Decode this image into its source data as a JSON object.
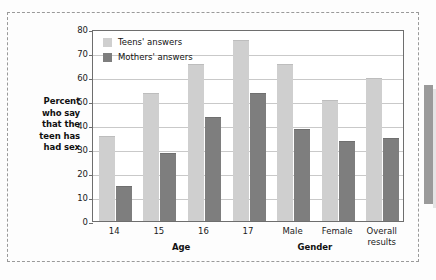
{
  "chart_data": {
    "type": "bar",
    "title": "",
    "xlabel": "",
    "ylabel": "Percent who say that the teen has had sex",
    "ylim": [
      0,
      80
    ],
    "yticks": [
      0,
      10,
      20,
      30,
      40,
      50,
      60,
      70,
      80
    ],
    "grid": true,
    "legend_position": "top-left",
    "categories": [
      "14",
      "15",
      "16",
      "17",
      "Male",
      "Female",
      "Overall results"
    ],
    "series": [
      {
        "name": "Teens' answers",
        "color": "#cfcfcf",
        "values": [
          35,
          53,
          65,
          75,
          65,
          50,
          59
        ]
      },
      {
        "name": "Mothers' answers",
        "color": "#7e7e7e",
        "values": [
          14,
          28,
          43,
          53,
          38,
          33,
          34
        ]
      }
    ],
    "group_labels": [
      {
        "label": "Age",
        "categories": [
          "14",
          "15",
          "16",
          "17"
        ]
      },
      {
        "label": "Gender",
        "categories": [
          "Male",
          "Female"
        ]
      }
    ]
  },
  "y_axis": {
    "title_lines": [
      "Percent",
      "who say",
      "that the",
      "teen has",
      "had sex"
    ],
    "tick_labels": [
      "80",
      "70",
      "60",
      "50",
      "40",
      "30",
      "20",
      "10",
      "0"
    ]
  },
  "x_axis": {
    "tick_labels": [
      "14",
      "15",
      "16",
      "17",
      "Male",
      "Female",
      "Overall results"
    ],
    "tick_label_lines": [
      [
        "14"
      ],
      [
        "15"
      ],
      [
        "16"
      ],
      [
        "17"
      ],
      [
        "Male"
      ],
      [
        "Female"
      ],
      [
        "Overall",
        "results"
      ]
    ],
    "group_titles": [
      "Age",
      "Gender"
    ]
  },
  "legend": {
    "items": [
      {
        "label": "Teens' answers",
        "swatch": "#cfcfcf"
      },
      {
        "label": "Mothers' answers",
        "swatch": "#7e7e7e"
      }
    ]
  }
}
